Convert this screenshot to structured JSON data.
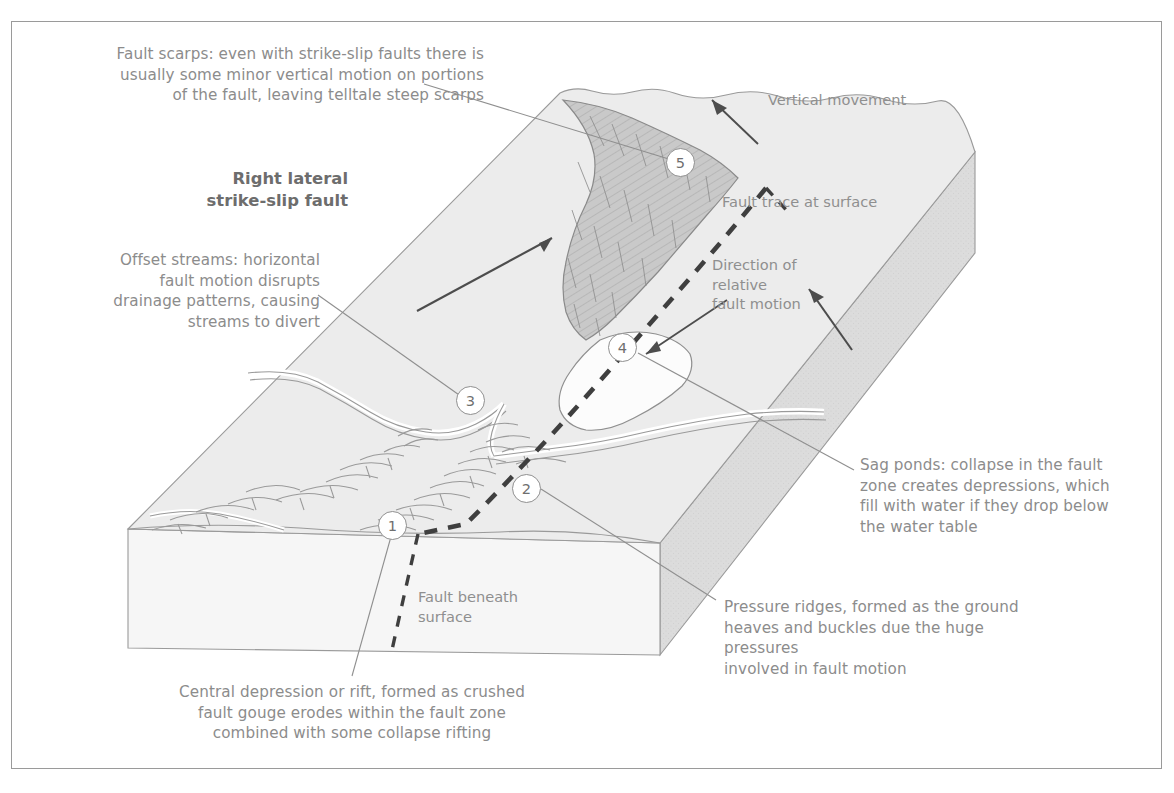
{
  "figure": {
    "title": "Right lateral\nstrike-slip fault",
    "kind": "block-diagram"
  },
  "colors": {
    "frame_border": "#9a9a9a",
    "text": "#8c8c8c",
    "title_text": "#6d6d6d",
    "top_surface": "#ececec",
    "front_face": "#f5f5f5",
    "right_face": "#dcdcdc",
    "scarp_fill": "#c9c9c9",
    "water_fill": "#fbfbfb",
    "line": "#8f8f8f",
    "fault_dash": "#4a4a4a"
  },
  "annotations": [
    {
      "key": "fault_scarps",
      "text": "Fault scarps: even with strike-slip faults there is\nusually some minor vertical motion on portions\nof the fault, leaving telltale steep scarps",
      "align": "right",
      "marker": "5"
    },
    {
      "key": "offset_streams",
      "text": "Offset streams: horizontal\nfault motion disrupts\ndrainage patterns, causing\nstreams to divert",
      "align": "right",
      "marker": "3"
    },
    {
      "key": "sag_ponds",
      "text": "Sag ponds: collapse in the fault\nzone creates depressions, which\nfill with water if they drop below\nthe water table",
      "align": "left",
      "marker": "4"
    },
    {
      "key": "pressure_ridges",
      "text": "Pressure ridges, formed as the ground\nheaves and buckles due the huge pressures\ninvolved in fault motion",
      "align": "left",
      "marker": "2"
    },
    {
      "key": "central_depression",
      "text": "Central depression or rift, formed as crushed\nfault gouge erodes within the fault zone\ncombined with some collapse rifting",
      "align": "center",
      "marker": "1"
    }
  ],
  "inline_labels": [
    {
      "key": "vertical_movement",
      "text": "Vertical movement"
    },
    {
      "key": "fault_trace",
      "text": "Fault trace at surface"
    },
    {
      "key": "relative_motion",
      "text": "Direction of\nrelative\nfault motion"
    },
    {
      "key": "fault_beneath",
      "text": "Fault beneath\nsurface"
    }
  ],
  "markers": [
    {
      "id": "1",
      "label": "1",
      "refers_to": "central_depression"
    },
    {
      "id": "2",
      "label": "2",
      "refers_to": "pressure_ridges"
    },
    {
      "id": "3",
      "label": "3",
      "refers_to": "offset_streams"
    },
    {
      "id": "4",
      "label": "4",
      "refers_to": "sag_ponds"
    },
    {
      "id": "5",
      "label": "5",
      "refers_to": "fault_scarps"
    }
  ]
}
